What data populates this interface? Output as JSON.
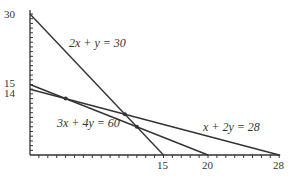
{
  "chart_data": {
    "type": "line",
    "title": "",
    "xlabel": "",
    "ylabel": "",
    "xlim": [
      0,
      28
    ],
    "ylim": [
      0,
      30
    ],
    "grid": false,
    "legend": "none (inline equation labels)",
    "x_tick_labels": [
      "15",
      "20",
      "28"
    ],
    "x_tick_values": [
      15,
      20,
      28
    ],
    "y_tick_labels": [
      "30",
      "15",
      "14"
    ],
    "y_tick_values": [
      30,
      15,
      14
    ],
    "series": [
      {
        "name": "2x + y = 30",
        "label": "2x + y = 30",
        "points": [
          [
            0,
            30
          ],
          [
            15,
            0
          ]
        ]
      },
      {
        "name": "3x + 4y = 60",
        "label": "3x + 4y = 60",
        "points": [
          [
            0,
            15
          ],
          [
            20,
            0
          ]
        ]
      },
      {
        "name": "x + 2y = 28",
        "label": "x + 2y = 28",
        "points": [
          [
            0,
            14
          ],
          [
            28,
            0
          ]
        ]
      }
    ],
    "intersections": [
      {
        "between": [
          "3x + 4y = 60",
          "x + 2y = 28"
        ],
        "x": 4,
        "y": 12
      },
      {
        "between": [
          "2x + y = 30",
          "x + 2y = 28"
        ],
        "x": 10.67,
        "y": 8.67
      },
      {
        "between": [
          "2x + y = 30",
          "3x + 4y = 60"
        ],
        "x": 12,
        "y": 6
      }
    ],
    "colors": {
      "line": "#333333",
      "axis": "#333333",
      "text": "#333333"
    }
  }
}
